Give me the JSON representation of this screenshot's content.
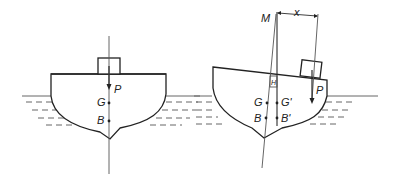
{
  "diagram": {
    "type": "ship-stability",
    "panels": [
      {
        "name": "upright",
        "labels": {
          "load": "P",
          "gravity": "G",
          "buoyancy": "B"
        }
      },
      {
        "name": "heeled",
        "labels": {
          "metacentre": "M",
          "offset": "x",
          "load": "P",
          "gravity": "G",
          "gravity_shifted": "G'",
          "buoyancy": "B",
          "buoyancy_shifted": "B'",
          "weight_marker": "H"
        }
      }
    ],
    "colors": {
      "line": "#2a2a2a",
      "water": "#666666",
      "background": "#ffffff"
    }
  }
}
